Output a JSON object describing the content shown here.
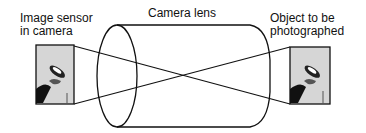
{
  "diagram": {
    "type": "camera-lens-optics",
    "labels": {
      "sensor": "Image sensor\nin camera",
      "lens": "Camera lens",
      "object": "Object to be\nphotographed"
    },
    "elements": {
      "sensor_image": "inverted photo of a fly-fishing lure",
      "object_image": "photo of a fly-fishing lure",
      "lens_shape": "cylinder"
    },
    "colors": {
      "stroke": "#111111",
      "photo_bg": "#d8d8d8",
      "background": "#ffffff"
    }
  }
}
